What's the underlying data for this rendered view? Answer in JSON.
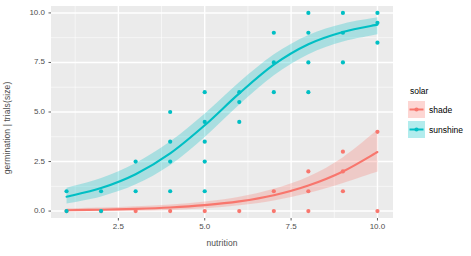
{
  "chart_data": {
    "type": "scatter",
    "title": "",
    "xlabel": "nutrition",
    "ylabel": "germination | trials(size)",
    "xlim": [
      0.55,
      10.45
    ],
    "ylim": [
      -0.35,
      10.35
    ],
    "xticks": [
      "2.5",
      "5.0",
      "7.5",
      "10.0"
    ],
    "xtick_values": [
      2.5,
      5.0,
      7.5,
      10.0
    ],
    "yticks": [
      "0.0",
      "2.5",
      "5.0",
      "7.5",
      "10.0"
    ],
    "ytick_values": [
      0.0,
      2.5,
      5.0,
      7.5,
      10.0
    ],
    "grid": true,
    "panel_background": "#EBEBEB",
    "grid_color": "#FFFFFF",
    "legend_position": "right",
    "legend": {
      "title": "solar",
      "entries": [
        {
          "label": "shade",
          "color": "#F8766D"
        },
        {
          "label": "sunshine",
          "color": "#00BFC4"
        }
      ]
    },
    "series": [
      {
        "name": "shade",
        "color": "#F8766D",
        "fit_type": "binomial-glm",
        "points": [
          {
            "x": 1,
            "y": 0
          },
          {
            "x": 2,
            "y": 0
          },
          {
            "x": 3,
            "y": 0
          },
          {
            "x": 4,
            "y": 0
          },
          {
            "x": 5,
            "y": 0
          },
          {
            "x": 6,
            "y": 0
          },
          {
            "x": 7,
            "y": 0
          },
          {
            "x": 8,
            "y": 0
          },
          {
            "x": 10,
            "y": 0
          },
          {
            "x": 7,
            "y": 1
          },
          {
            "x": 8,
            "y": 1
          },
          {
            "x": 9,
            "y": 1
          },
          {
            "x": 8,
            "y": 2
          },
          {
            "x": 9,
            "y": 2
          },
          {
            "x": 9,
            "y": 3
          },
          {
            "x": 10,
            "y": 4
          }
        ],
        "fit": [
          {
            "x": 1,
            "y": 0.04,
            "lo": 0.0,
            "hi": 0.14
          },
          {
            "x": 2,
            "y": 0.07,
            "lo": 0.01,
            "hi": 0.18
          },
          {
            "x": 3,
            "y": 0.11,
            "lo": 0.02,
            "hi": 0.24
          },
          {
            "x": 4,
            "y": 0.18,
            "lo": 0.06,
            "hi": 0.33
          },
          {
            "x": 5,
            "y": 0.3,
            "lo": 0.14,
            "hi": 0.48
          },
          {
            "x": 6,
            "y": 0.49,
            "lo": 0.29,
            "hi": 0.72
          },
          {
            "x": 7,
            "y": 0.8,
            "lo": 0.53,
            "hi": 1.12
          },
          {
            "x": 8,
            "y": 1.29,
            "lo": 0.91,
            "hi": 1.74
          },
          {
            "x": 9,
            "y": 2.0,
            "lo": 1.42,
            "hi": 2.72
          },
          {
            "x": 10,
            "y": 2.98,
            "lo": 2.0,
            "hi": 4.1
          }
        ]
      },
      {
        "name": "sunshine",
        "color": "#00BFC4",
        "fit_type": "binomial-glm",
        "points": [
          {
            "x": 1,
            "y": 0
          },
          {
            "x": 2,
            "y": 0
          },
          {
            "x": 2,
            "y": 1
          },
          {
            "x": 3,
            "y": 1
          },
          {
            "x": 4,
            "y": 1
          },
          {
            "x": 5,
            "y": 1
          },
          {
            "x": 1,
            "y": 1
          },
          {
            "x": 3,
            "y": 2.5
          },
          {
            "x": 4,
            "y": 2.5
          },
          {
            "x": 5,
            "y": 2.5
          },
          {
            "x": 4,
            "y": 3.5
          },
          {
            "x": 5,
            "y": 3.5
          },
          {
            "x": 4,
            "y": 5
          },
          {
            "x": 5,
            "y": 4.5
          },
          {
            "x": 6,
            "y": 4.5
          },
          {
            "x": 6,
            "y": 5.5
          },
          {
            "x": 6,
            "y": 6
          },
          {
            "x": 5,
            "y": 6
          },
          {
            "x": 7,
            "y": 6
          },
          {
            "x": 8,
            "y": 6
          },
          {
            "x": 7,
            "y": 7.5
          },
          {
            "x": 8,
            "y": 7.5
          },
          {
            "x": 7,
            "y": 9
          },
          {
            "x": 8,
            "y": 9
          },
          {
            "x": 9,
            "y": 9
          },
          {
            "x": 9,
            "y": 7.5
          },
          {
            "x": 10,
            "y": 9.5
          },
          {
            "x": 10,
            "y": 8.5
          },
          {
            "x": 9,
            "y": 10
          },
          {
            "x": 10,
            "y": 10
          },
          {
            "x": 8,
            "y": 10
          }
        ],
        "fit": [
          {
            "x": 1,
            "y": 0.72,
            "lo": 0.38,
            "hi": 1.18
          },
          {
            "x": 2,
            "y": 1.16,
            "lo": 0.74,
            "hi": 1.67
          },
          {
            "x": 3,
            "y": 1.86,
            "lo": 1.35,
            "hi": 2.43
          },
          {
            "x": 4,
            "y": 2.91,
            "lo": 2.33,
            "hi": 3.52
          },
          {
            "x": 5,
            "y": 4.33,
            "lo": 3.74,
            "hi": 4.93
          },
          {
            "x": 6,
            "y": 5.94,
            "lo": 5.38,
            "hi": 6.51
          },
          {
            "x": 7,
            "y": 7.39,
            "lo": 6.86,
            "hi": 7.91
          },
          {
            "x": 8,
            "y": 8.42,
            "lo": 7.92,
            "hi": 8.89
          },
          {
            "x": 9,
            "y": 9.04,
            "lo": 8.56,
            "hi": 9.46
          },
          {
            "x": 10,
            "y": 9.41,
            "lo": 8.93,
            "hi": 9.78
          }
        ]
      }
    ]
  }
}
